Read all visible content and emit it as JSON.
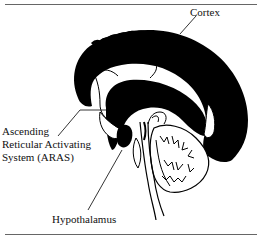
{
  "figure": {
    "labels": {
      "cortex": "Cortex",
      "aras_line1": "Ascending",
      "aras_line2": "Reticular Activating",
      "aras_line3": "System (ARAS)",
      "hypothalamus": "Hypothalamus"
    },
    "colors": {
      "fill": "#000000",
      "stroke": "#000000",
      "background": "#ffffff",
      "rule": "#666666"
    }
  }
}
